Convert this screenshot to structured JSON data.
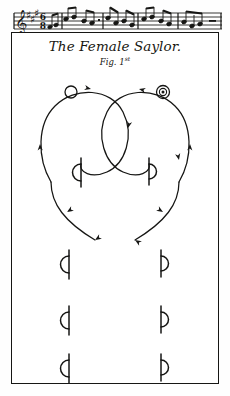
{
  "plate": {
    "kind": "dance-notation-plate",
    "background_color": "#ffffff",
    "ink_color": "#161614"
  },
  "music": {
    "label": "music-staff",
    "clef": "treble",
    "key_signature": "three sharps",
    "time_signature_top": "6",
    "time_signature_bottom": "8",
    "staff_lines": 5,
    "barlines": 5,
    "note_count": 22
  },
  "title": {
    "main": "The Female Saylor.",
    "figure": "Fig. 1",
    "figure_ordinal": "st"
  },
  "dancers": [
    {
      "id": "woman",
      "symbol": "hollow-circle",
      "x": 60,
      "y": 60,
      "r": 6
    },
    {
      "id": "man",
      "symbol": "double-circle-dot",
      "x": 152,
      "y": 60,
      "r": 6.5
    }
  ],
  "tracks": [
    {
      "id": "left-dancer-track",
      "direction": "clockwise-spiral",
      "path": "M 42 148 C 30 128 30 98 44 80 C 60 58 96 56 112 76 C 128 96 124 124 110 140 C 98 154 78 156 70 148 C 62 140 64 130 70 128",
      "tail_path": "M 42 148 C 40 166 56 184 80 200",
      "arrows": [
        {
          "x": 78,
          "y": 58,
          "angle": 8
        },
        {
          "x": 118,
          "y": 98,
          "angle": 100
        },
        {
          "x": 36,
          "y": 110,
          "angle": 268
        },
        {
          "x": 58,
          "y": 176,
          "angle": 140
        },
        {
          "x": 80,
          "y": 200,
          "angle": 142
        }
      ]
    },
    {
      "id": "right-dancer-track",
      "direction": "counter-clockwise-spiral",
      "path": "M 170 148 C 182 128 182 98 168 80 C 152 58 116 56 100 76 C 84 96 88 124 102 140 C 114 154 134 156 142 148 C 150 140 148 130 142 128",
      "tail_path": "M 170 148 C 172 166 156 184 132 200",
      "arrows": [
        {
          "x": 134,
          "y": 58,
          "angle": 186
        },
        {
          "x": 94,
          "y": 98,
          "angle": 80
        },
        {
          "x": 176,
          "y": 110,
          "angle": 272
        },
        {
          "x": 154,
          "y": 176,
          "angle": 40
        },
        {
          "x": 132,
          "y": 200,
          "angle": 38
        }
      ]
    }
  ],
  "foot_symbols": {
    "legend": "half-circle with vertical stem (dance step / position mark)",
    "rows": [
      {
        "row": 1,
        "y": 138,
        "left": {
          "id": "foot-left-r1",
          "orientation": "bulge-left",
          "x": 64,
          "size": 15
        },
        "right": {
          "id": "foot-right-r1",
          "orientation": "bulge-right",
          "x": 147,
          "size": 13
        }
      },
      {
        "row": 2,
        "y": 198,
        "left": {
          "id": "foot-left-r2",
          "orientation": "bulge-left",
          "x": 52,
          "size": 15
        },
        "right": {
          "id": "foot-right-r2",
          "orientation": "bulge-right",
          "x": 155,
          "size": 13
        }
      },
      {
        "row": 3,
        "y": 254,
        "left": {
          "id": "foot-left-r3",
          "orientation": "bulge-left",
          "x": 52,
          "size": 15
        },
        "right": {
          "id": "foot-right-r3",
          "orientation": "bulge-right",
          "x": 155,
          "size": 13
        }
      },
      {
        "row": 4,
        "y": 310,
        "left": {
          "id": "foot-left-r4",
          "orientation": "bulge-left",
          "x": 52,
          "size": 15
        },
        "right": {
          "id": "foot-right-r4",
          "orientation": "bulge-right",
          "x": 155,
          "size": 13
        }
      }
    ]
  }
}
